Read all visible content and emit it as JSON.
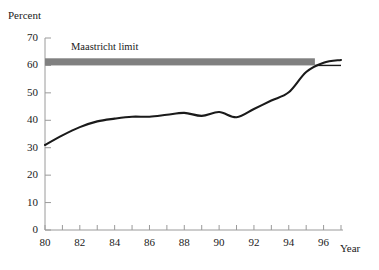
{
  "figure": {
    "background_color": "#ffffff",
    "ylabel": "Percent",
    "xlabel": "Year",
    "band_caption": "Maastricht limit"
  },
  "chart_data": {
    "type": "line",
    "title": "",
    "subtitle": "",
    "xlabel": "Year",
    "ylabel": "Percent",
    "xlim": [
      80,
      97
    ],
    "ylim": [
      0,
      70
    ],
    "grid": false,
    "legend": "none",
    "line_color": "#1a1a1a",
    "band_color": "#808080",
    "x_tick_labels": [
      "80",
      "82",
      "84",
      "86",
      "88",
      "90",
      "92",
      "94",
      "96"
    ],
    "x_tick_values": [
      80,
      82,
      84,
      86,
      88,
      90,
      92,
      94,
      96
    ],
    "x_minor_tick_values": [
      80,
      81,
      82,
      83,
      84,
      85,
      86,
      87,
      88,
      89,
      90,
      91,
      92,
      93,
      94,
      95,
      96,
      97
    ],
    "y_tick_labels": [
      "0",
      "10",
      "20",
      "30",
      "40",
      "50",
      "60",
      "70"
    ],
    "y_tick_values": [
      0,
      10,
      20,
      30,
      40,
      50,
      60,
      70
    ],
    "series": [
      {
        "name": "Government debt",
        "x": [
          80,
          81,
          82,
          83,
          84,
          85,
          86,
          87,
          88,
          89,
          90,
          91,
          92,
          93,
          94,
          95,
          96,
          97
        ],
        "values": [
          31.0,
          34.5,
          37.5,
          39.6,
          40.6,
          41.3,
          41.3,
          42.0,
          42.7,
          41.6,
          43.0,
          41.1,
          44.1,
          47.2,
          50.2,
          57.6,
          61.0,
          62.0
        ]
      }
    ],
    "annotations": [
      {
        "label": "Maastricht limit",
        "type": "horizontal-band",
        "y": 60,
        "band_thickness": 2.6,
        "x_start": 80,
        "x_end": 95.5,
        "color": "#808080"
      },
      {
        "label": "",
        "type": "horizontal-reference-line",
        "y": 60,
        "x_start": 95.5,
        "x_end": 97,
        "color": "#1a1a1a"
      }
    ]
  }
}
